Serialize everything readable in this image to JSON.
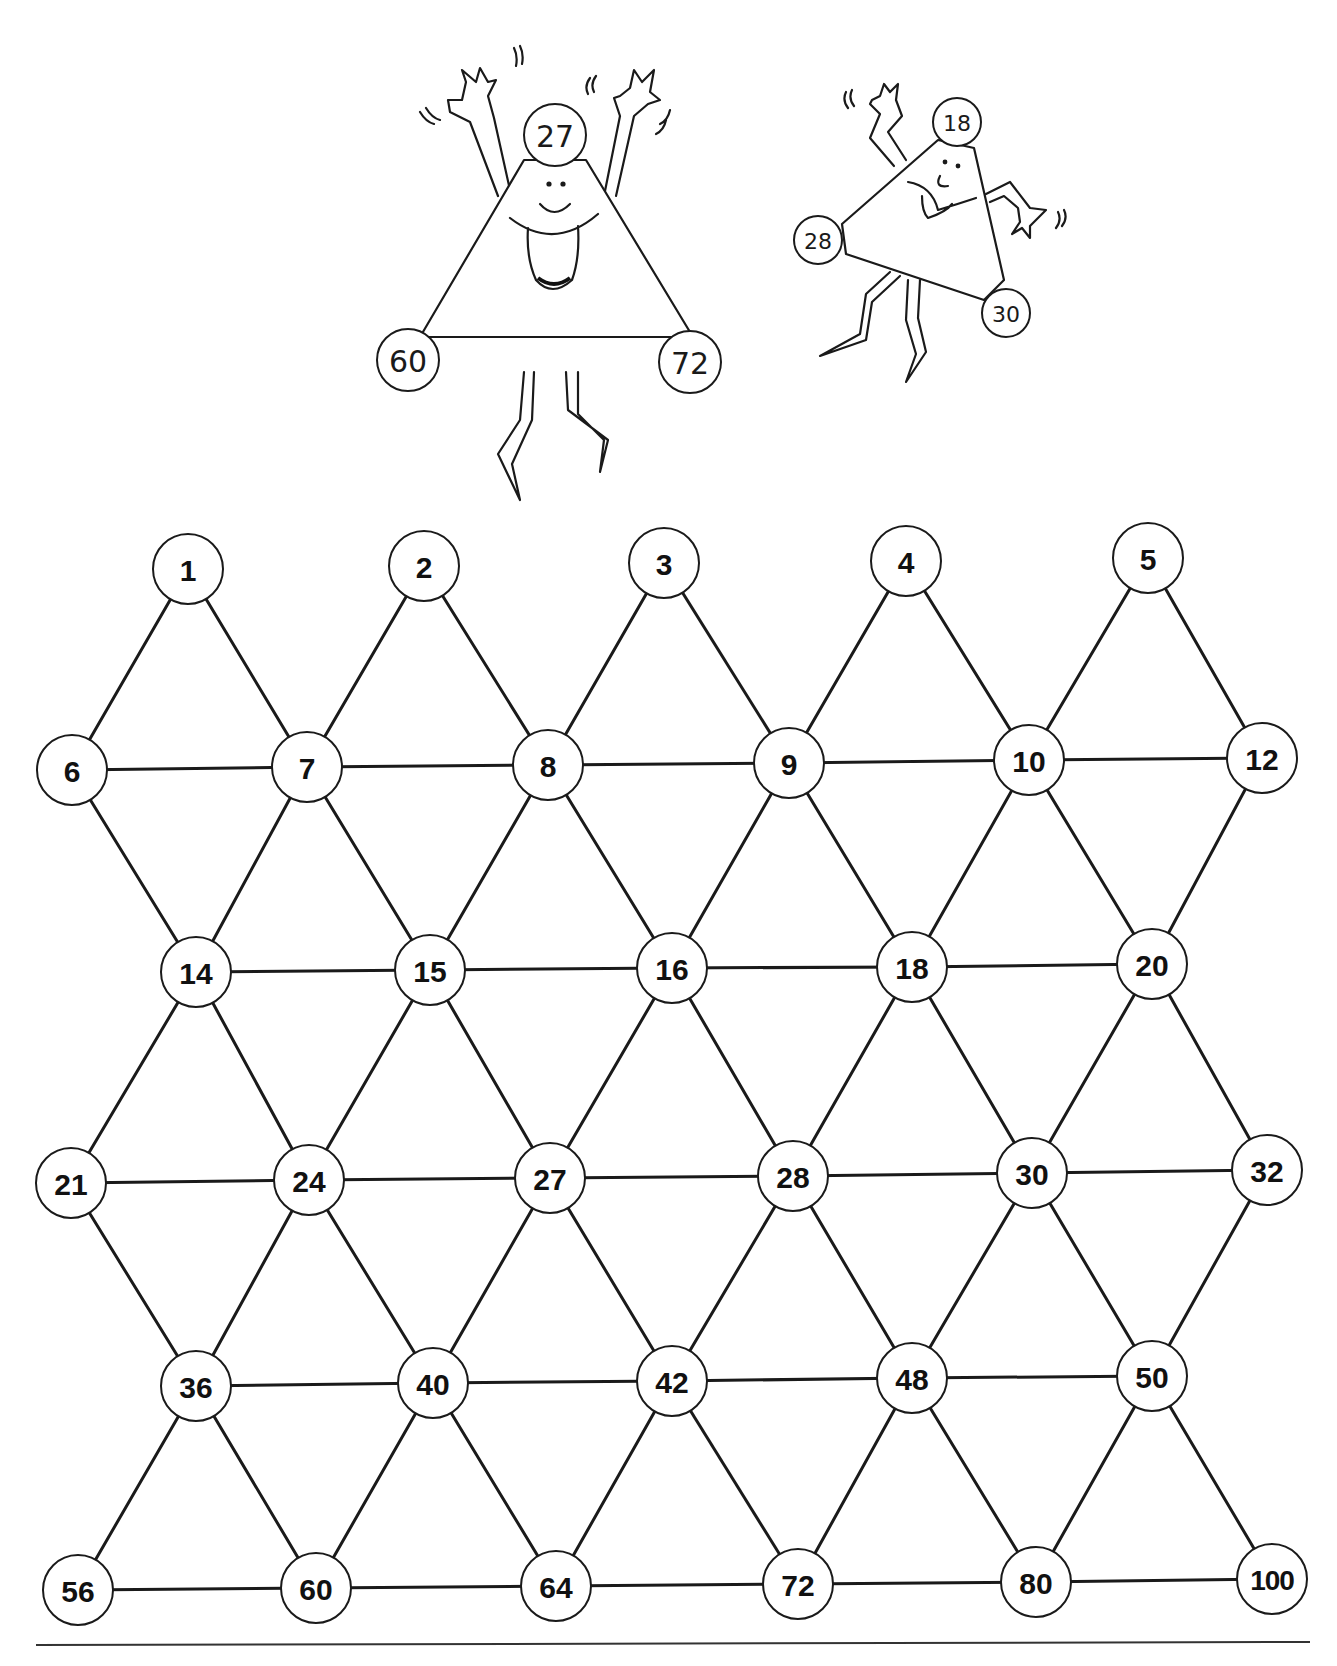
{
  "page": {
    "background": "#ffffff",
    "line_color": "#1a1a1a"
  },
  "mascots": [
    {
      "name": "big-triangle-mascot",
      "vertices": [
        {
          "label": "27",
          "x": 555,
          "y": 135
        },
        {
          "label": "60",
          "x": 408,
          "y": 360
        },
        {
          "label": "72",
          "x": 690,
          "y": 362
        }
      ]
    },
    {
      "name": "small-triangle-mascot",
      "vertices": [
        {
          "label": "18",
          "x": 957,
          "y": 122
        },
        {
          "label": "28",
          "x": 818,
          "y": 240
        },
        {
          "label": "30",
          "x": 1006,
          "y": 313
        }
      ]
    }
  ],
  "grid": {
    "node_radius": 35,
    "rows": [
      {
        "nodes": [
          {
            "label": "1",
            "x": 188,
            "y": 569
          },
          {
            "label": "2",
            "x": 424,
            "y": 566
          },
          {
            "label": "3",
            "x": 664,
            "y": 563
          },
          {
            "label": "4",
            "x": 906,
            "y": 561
          },
          {
            "label": "5",
            "x": 1148,
            "y": 558
          }
        ]
      },
      {
        "nodes": [
          {
            "label": "6",
            "x": 72,
            "y": 770
          },
          {
            "label": "7",
            "x": 307,
            "y": 767
          },
          {
            "label": "8",
            "x": 548,
            "y": 765
          },
          {
            "label": "9",
            "x": 789,
            "y": 763
          },
          {
            "label": "10",
            "x": 1029,
            "y": 760
          },
          {
            "label": "12",
            "x": 1262,
            "y": 758
          }
        ]
      },
      {
        "nodes": [
          {
            "label": "14",
            "x": 196,
            "y": 972
          },
          {
            "label": "15",
            "x": 430,
            "y": 970
          },
          {
            "label": "16",
            "x": 672,
            "y": 968
          },
          {
            "label": "18",
            "x": 912,
            "y": 967
          },
          {
            "label": "20",
            "x": 1152,
            "y": 964
          }
        ]
      },
      {
        "nodes": [
          {
            "label": "21",
            "x": 71,
            "y": 1183
          },
          {
            "label": "24",
            "x": 309,
            "y": 1180
          },
          {
            "label": "27",
            "x": 550,
            "y": 1178
          },
          {
            "label": "28",
            "x": 793,
            "y": 1176
          },
          {
            "label": "30",
            "x": 1032,
            "y": 1173
          },
          {
            "label": "32",
            "x": 1267,
            "y": 1170
          }
        ]
      },
      {
        "nodes": [
          {
            "label": "36",
            "x": 196,
            "y": 1386
          },
          {
            "label": "40",
            "x": 433,
            "y": 1383
          },
          {
            "label": "42",
            "x": 672,
            "y": 1381
          },
          {
            "label": "48",
            "x": 912,
            "y": 1378
          },
          {
            "label": "50",
            "x": 1152,
            "y": 1376
          }
        ]
      },
      {
        "nodes": [
          {
            "label": "56",
            "x": 78,
            "y": 1590
          },
          {
            "label": "60",
            "x": 316,
            "y": 1588
          },
          {
            "label": "64",
            "x": 556,
            "y": 1586
          },
          {
            "label": "72",
            "x": 798,
            "y": 1584
          },
          {
            "label": "80",
            "x": 1036,
            "y": 1582
          },
          {
            "label": "100",
            "x": 1272,
            "y": 1579
          }
        ]
      }
    ]
  },
  "footer": {
    "rule_y": 1645,
    "rule_x1": 36,
    "rule_x2": 1310
  }
}
